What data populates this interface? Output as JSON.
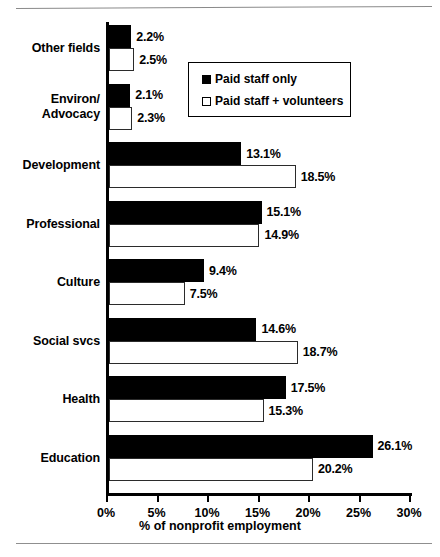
{
  "chart_data": {
    "type": "bar",
    "orientation": "horizontal",
    "title": "",
    "xlabel": "% of nonprofit employment",
    "ylabel": "",
    "xlim": [
      0,
      30
    ],
    "xticks": [
      "0%",
      "5%",
      "10%",
      "15%",
      "20%",
      "25%",
      "30%"
    ],
    "xtick_values": [
      0,
      5,
      10,
      15,
      20,
      25,
      30
    ],
    "grid": false,
    "legend_position": "upper-right-inside",
    "categories": [
      "Other fields",
      "Environ/ Advocacy",
      "Development",
      "Professional",
      "Culture",
      "Social svcs",
      "Health",
      "Education"
    ],
    "category_lines": [
      [
        "Other fields"
      ],
      [
        "Environ/",
        "Advocacy"
      ],
      [
        "Development"
      ],
      [
        "Professional"
      ],
      [
        "Culture"
      ],
      [
        "Social svcs"
      ],
      [
        "Health"
      ],
      [
        "Education"
      ]
    ],
    "series": [
      {
        "name": "Paid staff only",
        "color": "#000000",
        "style": "filled",
        "values": [
          2.2,
          2.1,
          13.1,
          15.1,
          9.4,
          14.6,
          17.5,
          26.1
        ],
        "labels": [
          "2.2%",
          "2.1%",
          "13.1%",
          "15.1%",
          "9.4%",
          "14.6%",
          "17.5%",
          "26.1%"
        ]
      },
      {
        "name": "Paid staff + volunteers",
        "color": "#ffffff",
        "style": "open",
        "values": [
          2.5,
          2.3,
          18.5,
          14.9,
          7.5,
          18.7,
          15.3,
          20.2
        ],
        "labels": [
          "2.5%",
          "2.3%",
          "18.5%",
          "14.9%",
          "7.5%",
          "18.7%",
          "15.3%",
          "20.2%"
        ]
      }
    ]
  },
  "legend": {
    "items": [
      {
        "label": "Paid staff only",
        "swatch": "filled-square-icon"
      },
      {
        "label": "Paid staff + volunteers",
        "swatch": "open-square-icon"
      }
    ]
  }
}
